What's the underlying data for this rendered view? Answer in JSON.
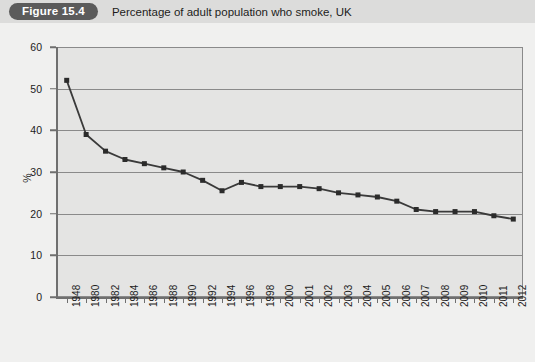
{
  "header": {
    "badge": "Figure 15.4",
    "title": "Percentage of adult population who smoke, UK"
  },
  "colors": {
    "header_background": "#dcdcdb",
    "badge_background": "#5b5b5b",
    "badge_text": "#ffffff",
    "page_background": "#f0f0ef",
    "plot_background": "#e4e4e3",
    "plot_border": "#8a8a8a",
    "gridline": "#8a8a8a",
    "series_line": "#3a3a3a",
    "marker": "#2b2b2b",
    "axis_text": "#1c1c1c"
  },
  "chart_data": {
    "type": "line",
    "title": "Percentage of adult population who smoke, UK",
    "xlabel": "",
    "ylabel": "%",
    "ylim": [
      0,
      60
    ],
    "ytick_step": 10,
    "yticks": [
      0,
      10,
      20,
      30,
      40,
      50,
      60
    ],
    "grid": true,
    "legend": "none",
    "marker": "square",
    "categories": [
      "1948",
      "1980",
      "1982",
      "1984",
      "1986",
      "1988",
      "1990",
      "1992",
      "1994",
      "1996",
      "1998",
      "2000",
      "2001",
      "2002",
      "2003",
      "2004",
      "2005",
      "2006",
      "2007",
      "2008",
      "2009",
      "2010",
      "2011",
      "2012"
    ],
    "series": [
      {
        "name": "Percentage of adults who smoke",
        "values": [
          52.0,
          39.0,
          35.0,
          33.0,
          32.0,
          31.0,
          30.0,
          28.0,
          25.5,
          27.5,
          26.5,
          26.5,
          26.5,
          26.0,
          25.0,
          24.5,
          24.0,
          23.0,
          21.0,
          20.5,
          20.5,
          20.5,
          19.5,
          18.7
        ]
      }
    ]
  }
}
